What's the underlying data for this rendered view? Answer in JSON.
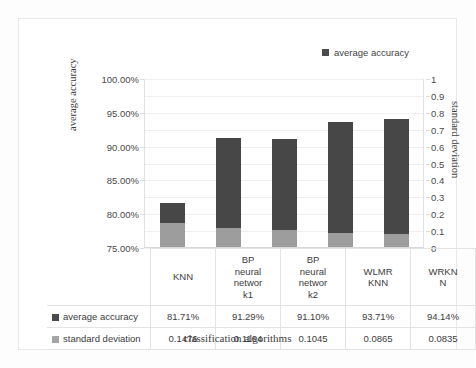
{
  "chart_data": {
    "type": "bar",
    "subtype": "stacked-column-dual-axis",
    "title": "",
    "xlabel": "classification algorithms",
    "ylabel": "average accuracy",
    "y2label": "standard deviation",
    "categories": [
      "KNN",
      "BP neural networ k1",
      "BP neural networ k2",
      "WLMR KNN",
      "WRKN N"
    ],
    "category_lines": [
      [
        "KNN"
      ],
      [
        "BP",
        "neural",
        "networ",
        "k1"
      ],
      [
        "BP",
        "neural",
        "networ",
        "k2"
      ],
      [
        "WLMR",
        "KNN"
      ],
      [
        "WRKN",
        "N"
      ]
    ],
    "series": [
      {
        "name": "average accuracy",
        "axis": "left",
        "color": "#474747",
        "values": [
          81.71,
          91.29,
          91.1,
          93.71,
          94.14
        ],
        "display_values": [
          "81.71%",
          "91.29%",
          "91.10%",
          "93.71%",
          "94.14%"
        ]
      },
      {
        "name": "standard deviation",
        "axis": "right",
        "color": "#9d9d9d",
        "values": [
          0.1476,
          0.1164,
          0.1045,
          0.0865,
          0.0835
        ],
        "display_values": [
          "0.1476",
          "0.1164",
          "0.1045",
          "0.0865",
          "0.0835"
        ]
      }
    ],
    "ylim": [
      75,
      100
    ],
    "yticks": [
      75,
      80,
      85,
      90,
      95,
      100
    ],
    "ytick_labels": [
      "75.00%",
      "80.00%",
      "85.00%",
      "90.00%",
      "95.00%",
      "100.00%"
    ],
    "y2lim": [
      0,
      1
    ],
    "y2ticks": [
      0,
      0.1,
      0.2,
      0.3,
      0.4,
      0.5,
      0.6,
      0.7,
      0.8,
      0.9,
      1
    ],
    "y2tick_labels": [
      "0",
      "0.1",
      "0.2",
      "0.3",
      "0.4",
      "0.5",
      "0.6",
      "0.7",
      "0.8",
      "0.9",
      "1"
    ],
    "grid": true,
    "grid_axis": "y",
    "legend": [
      "average accuracy"
    ],
    "legend_position": "top-right",
    "data_table": {
      "show": true,
      "row_labels": [
        "average accuracy",
        "standard deviation"
      ],
      "rows": [
        [
          "81.71%",
          "91.29%",
          "91.10%",
          "93.71%",
          "94.14%"
        ],
        [
          "0.1476",
          "0.1164",
          "0.1045",
          "0.0865",
          "0.0835"
        ]
      ]
    }
  },
  "legend": {
    "items": [
      {
        "label": "average accuracy",
        "color": "#4b4b4b"
      }
    ]
  },
  "axes": {
    "left": {
      "title": "average accuracy",
      "ticks": [
        "100.00%",
        "95.00%",
        "90.00%",
        "85.00%",
        "80.00%",
        "75.00%"
      ]
    },
    "right": {
      "title": "standard deviation",
      "ticks": [
        "1",
        "0.9",
        "0.8",
        "0.7",
        "0.6",
        "0.5",
        "0.4",
        "0.3",
        "0.2",
        "0.1",
        "0"
      ]
    },
    "bottom": {
      "title": "classification algorithms"
    }
  }
}
